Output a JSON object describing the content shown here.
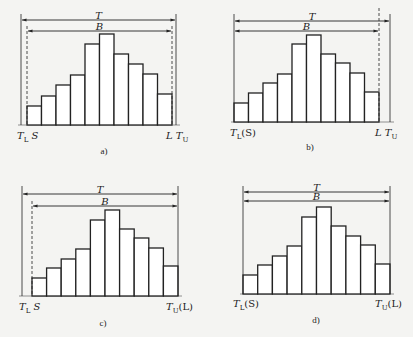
{
  "figure": {
    "colors": {
      "ink": "#222222",
      "background": "#f4f4f2",
      "bar_fill": "#ffffff"
    }
  },
  "chart_data": [
    {
      "type": "bar",
      "panel": "a",
      "caption": "a)",
      "values": [
        19,
        29,
        40,
        50,
        81,
        91,
        71,
        61,
        51,
        31
      ],
      "baseline_y": 125,
      "bars_x": [
        27,
        172
      ],
      "T": {
        "label": "T",
        "left_x": 21,
        "right_x": 176,
        "y": 20
      },
      "B": {
        "label": "B",
        "left_x": 27,
        "right_x": 172,
        "y": 31
      },
      "guides": [
        {
          "x": 21,
          "style": "solid",
          "top": 14
        },
        {
          "x": 27,
          "style": "dashed",
          "top": 26
        },
        {
          "x": 172,
          "style": "dashed",
          "top": 26
        },
        {
          "x": 176,
          "style": "solid",
          "top": 14
        }
      ],
      "labels_left": {
        "main": "T",
        "sub": "L",
        "extra": " S",
        "x": 17
      },
      "labels_right": {
        "main": "L T",
        "sub": "U",
        "extra": "",
        "x": 166
      },
      "caption_x": 104,
      "caption_y": 154,
      "label_y": 139
    },
    {
      "type": "bar",
      "panel": "b",
      "caption": "b)",
      "values": [
        19,
        29,
        39,
        48,
        78,
        87,
        68,
        59,
        49,
        30
      ],
      "baseline_y": 122,
      "bars_x": [
        234,
        379
      ],
      "T": {
        "label": "T",
        "left_x": 234,
        "right_x": 390,
        "y": 21
      },
      "B": {
        "label": "B",
        "left_x": 234,
        "right_x": 379,
        "y": 31
      },
      "guides": [
        {
          "x": 234,
          "style": "solid",
          "top": 14
        },
        {
          "x": 379,
          "style": "dashed",
          "top": 8
        },
        {
          "x": 390,
          "style": "solid",
          "top": 14
        }
      ],
      "labels_left": {
        "main": "T",
        "sub": "L",
        "extra": "(S)",
        "x": 230
      },
      "labels_right": {
        "main": "L T",
        "sub": "U",
        "extra": "",
        "x": 375
      },
      "caption_x": 310,
      "caption_y": 150,
      "label_y": 136
    },
    {
      "type": "bar",
      "panel": "c",
      "caption": "c)",
      "values": [
        18,
        28,
        37,
        47,
        76,
        86,
        67,
        58,
        48,
        30
      ],
      "baseline_y": 296,
      "bars_x": [
        32,
        178
      ],
      "T": {
        "label": "T",
        "left_x": 22,
        "right_x": 178,
        "y": 194
      },
      "B": {
        "label": "B",
        "left_x": 32,
        "right_x": 178,
        "y": 206
      },
      "guides": [
        {
          "x": 22,
          "style": "solid",
          "top": 186
        },
        {
          "x": 32,
          "style": "dashed",
          "top": 201
        },
        {
          "x": 178,
          "style": "solid",
          "top": 186
        }
      ],
      "labels_left": {
        "main": "T",
        "sub": "L",
        "extra": "  S",
        "x": 19
      },
      "labels_right": {
        "main": "T",
        "sub": "U",
        "extra": "(L)",
        "x": 166
      },
      "caption_x": 103,
      "caption_y": 326,
      "label_y": 310
    },
    {
      "type": "bar",
      "panel": "d",
      "caption": "d)",
      "values": [
        19,
        29,
        38,
        48,
        77,
        87,
        68,
        58,
        49,
        30
      ],
      "baseline_y": 294,
      "bars_x": [
        243,
        390
      ],
      "T": {
        "label": "T",
        "left_x": 243,
        "right_x": 390,
        "y": 192
      },
      "B": {
        "label": "B",
        "left_x": 243,
        "right_x": 390,
        "y": 201
      },
      "guides": [
        {
          "x": 243,
          "style": "solid",
          "top": 186
        },
        {
          "x": 390,
          "style": "solid",
          "top": 186
        }
      ],
      "labels_left": {
        "main": "T",
        "sub": "L",
        "extra": "(S)",
        "x": 233
      },
      "labels_right": {
        "main": "T",
        "sub": "U",
        "extra": "(L)",
        "x": 375
      },
      "caption_x": 316,
      "caption_y": 323,
      "label_y": 307
    }
  ]
}
